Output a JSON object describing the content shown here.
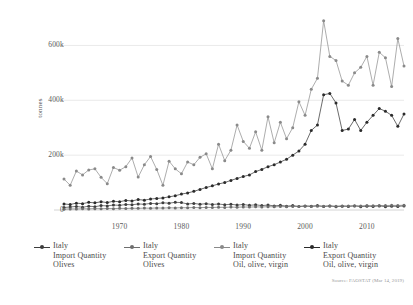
{
  "chart_data": {
    "type": "line",
    "title": "",
    "subtitle": "",
    "xlabel": "",
    "ylabel": "tonnes",
    "xlim": [
      1961,
      2016
    ],
    "ylim": [
      0,
      700000
    ],
    "grid": true,
    "legend_position": "bottom",
    "y_ticks": [
      0,
      200000,
      400000,
      600000
    ],
    "y_tick_labels": [
      "0",
      "200k",
      "400k",
      "600k"
    ],
    "x_ticks": [
      1970,
      1980,
      1990,
      2000,
      2010
    ],
    "x_tick_labels": [
      "1970",
      "1980",
      "1990",
      "2000",
      "2010"
    ],
    "x": [
      1961,
      1962,
      1963,
      1964,
      1965,
      1966,
      1967,
      1968,
      1969,
      1970,
      1971,
      1972,
      1973,
      1974,
      1975,
      1976,
      1977,
      1978,
      1979,
      1980,
      1981,
      1982,
      1983,
      1984,
      1985,
      1986,
      1987,
      1988,
      1989,
      1990,
      1991,
      1992,
      1993,
      1994,
      1995,
      1996,
      1997,
      1998,
      1999,
      2000,
      2001,
      2002,
      2003,
      2004,
      2005,
      2006,
      2007,
      2008,
      2009,
      2010,
      2011,
      2012,
      2013,
      2014,
      2015,
      2016
    ],
    "series": [
      {
        "name": "Italy Import Quantity Olives",
        "label_line1": "Italy",
        "label_line2": "Import Quantity",
        "label_line3": "Olives",
        "color": "#3d3d3d",
        "values": [
          9000,
          11000,
          13000,
          10000,
          14000,
          12000,
          16000,
          15000,
          18000,
          17000,
          20000,
          19000,
          22000,
          21000,
          24000,
          23000,
          26000,
          25000,
          28000,
          27000,
          22000,
          24000,
          21000,
          23000,
          20000,
          22000,
          19000,
          21000,
          18000,
          20000,
          17000,
          19000,
          16000,
          18000,
          15000,
          17000,
          14000,
          16000,
          13000,
          15000,
          14000,
          16000,
          13000,
          15000,
          12000,
          14000,
          13000,
          15000,
          12000,
          14000,
          13000,
          15000,
          12000,
          14000,
          13000,
          15000
        ]
      },
      {
        "name": "Italy Export Quantity Olives",
        "label_line1": "Italy",
        "label_line2": "Export Quantity",
        "label_line3": "Olives",
        "color": "#6e6e6e",
        "values": [
          3000,
          4000,
          3500,
          4500,
          4000,
          5000,
          4500,
          5500,
          5000,
          6000,
          5500,
          6500,
          6000,
          7000,
          6500,
          7500,
          7000,
          8000,
          7500,
          8500,
          8000,
          9000,
          8500,
          9500,
          9000,
          10000,
          9500,
          10500,
          10000,
          11000,
          10500,
          11500,
          11000,
          12000,
          11500,
          12500,
          12000,
          13000,
          12500,
          13500,
          13000,
          14000,
          13500,
          14500,
          14000,
          15000,
          14500,
          15500,
          15000,
          16000,
          15500,
          16500,
          16000,
          17000,
          16500,
          17500
        ]
      },
      {
        "name": "Italy Import Quantity Oil, olive, virgin",
        "label_line1": "Italy",
        "label_line2": "Import Quantity",
        "label_line3": "Oil, olive, virgin",
        "color": "#8a8a8a",
        "values": [
          113000,
          90000,
          142000,
          128000,
          146000,
          150000,
          119000,
          96000,
          155000,
          145000,
          158000,
          190000,
          120000,
          165000,
          195000,
          148000,
          90000,
          178000,
          150000,
          132000,
          175000,
          165000,
          192000,
          205000,
          150000,
          240000,
          180000,
          218000,
          310000,
          250000,
          225000,
          285000,
          218000,
          340000,
          245000,
          320000,
          260000,
          300000,
          395000,
          345000,
          440000,
          480000,
          690000,
          560000,
          545000,
          470000,
          455000,
          500000,
          520000,
          560000,
          455000,
          575000,
          555000,
          450000,
          625000,
          525000
        ]
      },
      {
        "name": "Italy Export Quantity Oil, olive, virgin",
        "label_line1": "Italy",
        "label_line2": "Export Quantity",
        "label_line3": "Oil, olive, virgin",
        "color": "#2b2b2b",
        "values": [
          22000,
          20000,
          25000,
          23000,
          28000,
          26000,
          30000,
          27000,
          32000,
          30000,
          35000,
          33000,
          38000,
          36000,
          40000,
          42000,
          44000,
          48000,
          52000,
          58000,
          62000,
          68000,
          75000,
          82000,
          88000,
          95000,
          100000,
          108000,
          115000,
          122000,
          128000,
          140000,
          148000,
          158000,
          165000,
          175000,
          185000,
          200000,
          215000,
          240000,
          290000,
          310000,
          420000,
          425000,
          390000,
          290000,
          295000,
          330000,
          290000,
          320000,
          345000,
          370000,
          360000,
          345000,
          305000,
          350000
        ]
      }
    ],
    "source_note": "Source: FAOSTAT (Mar 14, 2019)"
  }
}
